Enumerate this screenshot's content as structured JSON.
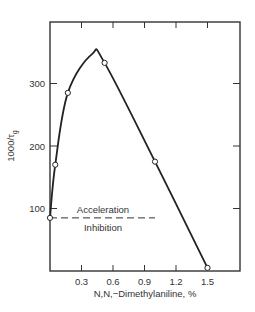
{
  "chart_data": {
    "type": "line",
    "title": "",
    "xlabel": "N,N,−Dimethylaniline, %",
    "ylabel": "1000/τg",
    "xlim": [
      0,
      1.8
    ],
    "ylim": [
      0,
      398
    ],
    "xticks": [
      0.3,
      0.6,
      0.9,
      1.2,
      1.5
    ],
    "xtick_labels": [
      "0.3",
      "0.6",
      "0.9",
      "1.2",
      "1.5"
    ],
    "yticks": [
      100,
      200,
      300
    ],
    "ytick_labels": [
      "100",
      "200",
      "300"
    ],
    "grid": false,
    "series": [
      {
        "name": "measured",
        "x": [
          0.0,
          0.05,
          0.17,
          0.52,
          1.0,
          1.5
        ],
        "y": [
          85,
          170,
          285,
          333,
          175,
          5
        ]
      }
    ],
    "curve_peak": {
      "x": 0.4,
      "y": 347
    },
    "reference_line": {
      "y": 85,
      "style": "dashed",
      "x_end": 1.0
    },
    "annotations": [
      {
        "text": "Acceleration",
        "position": "above reference line"
      },
      {
        "text": "Inhibition",
        "position": "below reference line"
      }
    ]
  }
}
